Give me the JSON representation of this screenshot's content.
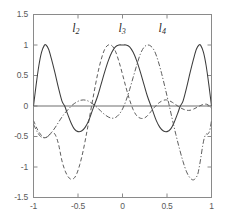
{
  "chart_data": {
    "type": "line",
    "title": "",
    "xlabel": "",
    "ylabel": "",
    "xlim": [
      -1,
      1
    ],
    "ylim": [
      -1.5,
      1.5
    ],
    "grid": false,
    "legend_position": "inline-annotations",
    "xticks": [
      -1,
      -0.5,
      0,
      0.5,
      1
    ],
    "xtick_labels": [
      "-1",
      "-0.5",
      "0",
      "0.5",
      "1"
    ],
    "yticks": [
      -1.5,
      -1,
      -0.5,
      0,
      0.5,
      1,
      1.5
    ],
    "ytick_labels": [
      "-1.5",
      "-1",
      "-0.5",
      "0",
      "0.5",
      "1",
      "1.5"
    ],
    "annotations": [
      {
        "text": "l",
        "sub": "2",
        "x": -0.52,
        "y": 1.27
      },
      {
        "text": "l",
        "sub": "3",
        "x": 0.0,
        "y": 1.27
      },
      {
        "text": "l",
        "sub": "4",
        "x": 0.45,
        "y": 1.27
      }
    ],
    "series": [
      {
        "name": "l_2",
        "style": "dashed",
        "color": "#555555",
        "nodes_x": [
          -1,
          -0.87,
          -0.65,
          -0.5,
          -0.32,
          0,
          0.32,
          0.65,
          0.87,
          1
        ],
        "points": [
          [
            -1.0,
            -0.24
          ],
          [
            -0.95,
            -0.4
          ],
          [
            -0.9,
            -0.5
          ],
          [
            -0.87,
            -0.52
          ],
          [
            -0.84,
            -0.5
          ],
          [
            -0.8,
            -0.44
          ],
          [
            -0.76,
            -0.46
          ],
          [
            -0.72,
            -0.62
          ],
          [
            -0.68,
            -0.9
          ],
          [
            -0.64,
            -1.08
          ],
          [
            -0.6,
            -1.18
          ],
          [
            -0.56,
            -1.2
          ],
          [
            -0.52,
            -1.13
          ],
          [
            -0.48,
            -0.96
          ],
          [
            -0.44,
            -0.72
          ],
          [
            -0.4,
            -0.42
          ],
          [
            -0.36,
            -0.1
          ],
          [
            -0.32,
            0.22
          ],
          [
            -0.28,
            0.52
          ],
          [
            -0.24,
            0.76
          ],
          [
            -0.2,
            0.93
          ],
          [
            -0.16,
            1.0
          ],
          [
            -0.12,
            0.99
          ],
          [
            -0.08,
            0.9
          ],
          [
            -0.04,
            0.73
          ],
          [
            0.0,
            0.52
          ],
          [
            0.04,
            0.3
          ],
          [
            0.08,
            0.1
          ],
          [
            0.12,
            -0.06
          ],
          [
            0.16,
            -0.16
          ],
          [
            0.2,
            -0.2
          ],
          [
            0.24,
            -0.2
          ],
          [
            0.28,
            -0.16
          ],
          [
            0.32,
            -0.09
          ],
          [
            0.36,
            -0.02
          ],
          [
            0.4,
            0.04
          ],
          [
            0.44,
            0.08
          ],
          [
            0.48,
            0.1
          ],
          [
            0.52,
            0.09
          ],
          [
            0.56,
            0.06
          ],
          [
            0.6,
            0.02
          ],
          [
            0.64,
            -0.02
          ],
          [
            0.68,
            -0.05
          ],
          [
            0.72,
            -0.07
          ],
          [
            0.76,
            -0.07
          ],
          [
            0.8,
            -0.05
          ],
          [
            0.84,
            -0.02
          ],
          [
            0.88,
            0.01
          ],
          [
            0.92,
            0.03
          ],
          [
            0.96,
            0.02
          ],
          [
            1.0,
            -0.04
          ]
        ]
      },
      {
        "name": "l_3",
        "style": "solid",
        "color": "#3c3c3c",
        "points": [
          [
            -1.0,
            0.0
          ],
          [
            -0.97,
            0.35
          ],
          [
            -0.94,
            0.66
          ],
          [
            -0.91,
            0.88
          ],
          [
            -0.88,
            0.99
          ],
          [
            -0.86,
            1.0
          ],
          [
            -0.83,
            0.93
          ],
          [
            -0.8,
            0.78
          ],
          [
            -0.76,
            0.55
          ],
          [
            -0.72,
            0.3
          ],
          [
            -0.68,
            0.08
          ],
          [
            -0.65,
            0.0
          ],
          [
            -0.62,
            -0.12
          ],
          [
            -0.58,
            -0.27
          ],
          [
            -0.54,
            -0.38
          ],
          [
            -0.5,
            -0.42
          ],
          [
            -0.46,
            -0.41
          ],
          [
            -0.42,
            -0.35
          ],
          [
            -0.38,
            -0.24
          ],
          [
            -0.34,
            -0.08
          ],
          [
            -0.32,
            0.0
          ],
          [
            -0.28,
            0.16
          ],
          [
            -0.24,
            0.36
          ],
          [
            -0.2,
            0.56
          ],
          [
            -0.16,
            0.74
          ],
          [
            -0.12,
            0.88
          ],
          [
            -0.08,
            0.97
          ],
          [
            -0.04,
            1.0
          ],
          [
            0.0,
            1.0
          ],
          [
            0.04,
            1.0
          ],
          [
            0.08,
            0.97
          ],
          [
            0.12,
            0.88
          ],
          [
            0.16,
            0.74
          ],
          [
            0.2,
            0.56
          ],
          [
            0.24,
            0.36
          ],
          [
            0.28,
            0.16
          ],
          [
            0.32,
            0.0
          ],
          [
            0.34,
            -0.08
          ],
          [
            0.38,
            -0.24
          ],
          [
            0.42,
            -0.35
          ],
          [
            0.46,
            -0.41
          ],
          [
            0.5,
            -0.42
          ],
          [
            0.54,
            -0.38
          ],
          [
            0.58,
            -0.27
          ],
          [
            0.62,
            -0.12
          ],
          [
            0.65,
            0.0
          ],
          [
            0.68,
            0.08
          ],
          [
            0.72,
            0.3
          ],
          [
            0.76,
            0.55
          ],
          [
            0.8,
            0.78
          ],
          [
            0.83,
            0.93
          ],
          [
            0.86,
            1.0
          ],
          [
            0.88,
            0.99
          ],
          [
            0.91,
            0.88
          ],
          [
            0.94,
            0.66
          ],
          [
            0.97,
            0.35
          ],
          [
            1.0,
            0.0
          ]
        ]
      },
      {
        "name": "l_4",
        "style": "dashdot",
        "color": "#555555",
        "points": [
          [
            -1.0,
            -0.3
          ],
          [
            -0.96,
            -0.42
          ],
          [
            -0.92,
            -0.5
          ],
          [
            -0.88,
            -0.52
          ],
          [
            -0.84,
            -0.5
          ],
          [
            -0.8,
            -0.44
          ],
          [
            -0.76,
            -0.36
          ],
          [
            -0.72,
            -0.27
          ],
          [
            -0.68,
            -0.18
          ],
          [
            -0.65,
            -0.12
          ],
          [
            -0.6,
            -0.04
          ],
          [
            -0.56,
            0.02
          ],
          [
            -0.52,
            0.06
          ],
          [
            -0.48,
            0.09
          ],
          [
            -0.44,
            0.1
          ],
          [
            -0.4,
            0.09
          ],
          [
            -0.36,
            0.06
          ],
          [
            -0.32,
            0.02
          ],
          [
            -0.28,
            -0.03
          ],
          [
            -0.24,
            -0.09
          ],
          [
            -0.2,
            -0.14
          ],
          [
            -0.16,
            -0.18
          ],
          [
            -0.12,
            -0.2
          ],
          [
            -0.08,
            -0.19
          ],
          [
            -0.04,
            -0.14
          ],
          [
            0.0,
            -0.05
          ],
          [
            0.04,
            0.09
          ],
          [
            0.08,
            0.27
          ],
          [
            0.12,
            0.47
          ],
          [
            0.16,
            0.67
          ],
          [
            0.2,
            0.85
          ],
          [
            0.24,
            0.96
          ],
          [
            0.28,
            1.0
          ],
          [
            0.32,
            0.98
          ],
          [
            0.36,
            0.9
          ],
          [
            0.4,
            0.74
          ],
          [
            0.44,
            0.53
          ],
          [
            0.48,
            0.29
          ],
          [
            0.52,
            0.04
          ],
          [
            0.56,
            -0.22
          ],
          [
            0.6,
            -0.47
          ],
          [
            0.64,
            -0.7
          ],
          [
            0.68,
            -0.91
          ],
          [
            0.72,
            -1.08
          ],
          [
            0.76,
            -1.18
          ],
          [
            0.8,
            -1.21
          ],
          [
            0.84,
            -1.14
          ],
          [
            0.86,
            -1.02
          ],
          [
            0.88,
            -0.85
          ],
          [
            0.9,
            -0.66
          ],
          [
            0.92,
            -0.52
          ],
          [
            0.94,
            -0.46
          ],
          [
            0.96,
            -0.46
          ],
          [
            0.98,
            -0.4
          ],
          [
            1.0,
            -0.24
          ]
        ]
      }
    ],
    "zero_line": {
      "y": 0,
      "color": "#6e6e6e"
    }
  },
  "axes": {
    "frame_color": "#8a8a8a",
    "tick_color": "#8a8a8a"
  }
}
